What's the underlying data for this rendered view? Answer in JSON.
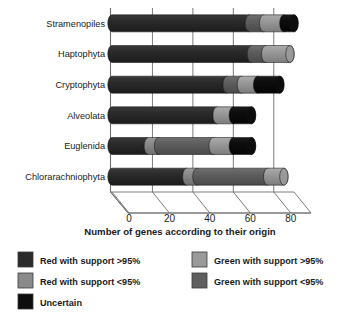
{
  "chart_data": {
    "type": "bar",
    "orientation": "horizontal-stacked-3d",
    "title": "",
    "xlabel": "Number of genes according to their origin",
    "ylabel": "",
    "xlim": [
      0,
      90
    ],
    "xticks": [
      0,
      20,
      40,
      60,
      80
    ],
    "xtick_labels": [
      "0",
      "20",
      "40",
      "60",
      "80"
    ],
    "grid": true,
    "legend_position": "bottom",
    "categories": [
      "Stramenopiles",
      "Haptophyta",
      "Cryptophyta",
      "Alveolata",
      "Euglenida",
      "Chlorarachniophyta"
    ],
    "series": [
      {
        "name": "Red with support >95%",
        "key": "red_high",
        "color": "#2b2b2b",
        "values": [
          68,
          69,
          57,
          52,
          18,
          37
        ]
      },
      {
        "name": "Red with support <95%",
        "key": "red_low",
        "color": "#8a8a8a",
        "values": [
          0,
          0,
          0,
          0,
          5,
          5
        ]
      },
      {
        "name": "Green with support >95%",
        "key": "green_high",
        "color": "#9a9a9a",
        "values": [
          10,
          12,
          8,
          8,
          10,
          8
        ]
      },
      {
        "name": "Green with support <95%",
        "key": "green_low",
        "color": "#5f5f5f",
        "values": [
          7,
          7,
          7,
          0,
          27,
          35
        ]
      },
      {
        "name": "Uncertain",
        "key": "uncertain",
        "color": "#0d0d0d",
        "values": [
          5,
          0,
          11,
          9,
          9,
          0
        ]
      }
    ],
    "stack_order": [
      "red_high",
      "red_low",
      "green_low",
      "green_high",
      "uncertain"
    ],
    "totals": [
      90,
      88,
      83,
      69,
      69,
      85
    ]
  },
  "legend": {
    "items": [
      {
        "label": "Red with support >95%",
        "color": "#2b2b2b"
      },
      {
        "label": "Red with support <95%",
        "color": "#8a8a8a"
      },
      {
        "label": "Uncertain",
        "color": "#0d0d0d"
      },
      {
        "label": "Green with support >95%",
        "color": "#9a9a9a"
      },
      {
        "label": "Green with support <95%",
        "color": "#5f5f5f"
      }
    ]
  },
  "axis": {
    "x_title": "Number of genes according to their origin",
    "ticks": [
      "0",
      "20",
      "40",
      "60",
      "80"
    ]
  }
}
